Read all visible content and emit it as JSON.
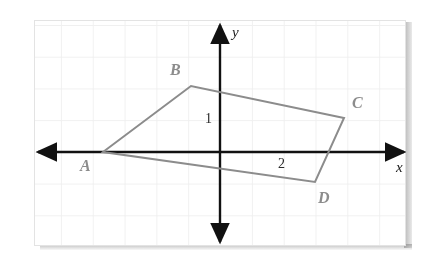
{
  "figure": {
    "background_color": "#ffffff",
    "frame": {
      "x": 34,
      "y": 20,
      "width": 372,
      "height": 226,
      "border_color": "#e3e3e3"
    },
    "grid": {
      "visible": true,
      "spacing_px": 32,
      "color": "#f0f0f0"
    },
    "origin": {
      "x": 220,
      "y": 152
    },
    "unit_px": 32,
    "axes": {
      "color": "#111111",
      "x_axis": {
        "label": "x",
        "label_x": 396,
        "label_y": 160,
        "from_x": 38,
        "to_x": 404,
        "y": 152
      },
      "y_axis": {
        "label": "y",
        "label_x": 232,
        "label_y": 25,
        "x": 220,
        "from_y": 25,
        "to_y": 242
      }
    },
    "tick_labels": [
      {
        "text": "1",
        "x": 205,
        "y": 112,
        "axis": "y"
      },
      {
        "text": "2",
        "x": 278,
        "y": 157,
        "axis": "x"
      }
    ],
    "shape": {
      "name": "quadrilateral-abcd",
      "stroke_color": "#8c8c8c",
      "stroke_width": 2,
      "fill": "none",
      "closed": true
    }
  },
  "chart_data": {
    "type": "scatter",
    "title": "",
    "xlabel": "x",
    "ylabel": "y",
    "grid": true,
    "legend": false,
    "unit_px": 32,
    "xlim": [
      -5.7,
      5.8
    ],
    "ylim": [
      -2.8,
      4.0
    ],
    "tick_labels": [
      "1",
      "2"
    ],
    "annotations": [
      "A",
      "B",
      "C",
      "D",
      "1",
      "2",
      "x",
      "y"
    ],
    "series": [
      {
        "name": "quadrilateral ABCD",
        "closed": true,
        "points": [
          {
            "label": "A",
            "px": 103,
            "py": 152,
            "x": -3.7,
            "y": 0.0,
            "label_px": 80,
            "label_py": 158
          },
          {
            "label": "B",
            "px": 191,
            "py": 86,
            "x": -0.9,
            "y": 2.1,
            "label_px": 170,
            "label_py": 62
          },
          {
            "label": "C",
            "px": 344,
            "py": 118,
            "x": 3.9,
            "y": 1.1,
            "label_px": 352,
            "label_py": 95
          },
          {
            "label": "D",
            "px": 315,
            "py": 182,
            "x": 3.0,
            "y": -0.9,
            "label_px": 318,
            "label_py": 190
          }
        ]
      }
    ]
  }
}
